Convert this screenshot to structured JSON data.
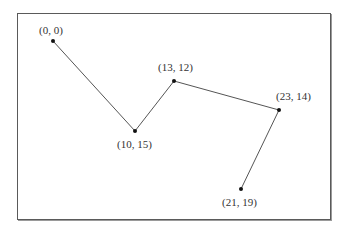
{
  "chart_data": {
    "type": "line",
    "title": "",
    "xlabel": "",
    "ylabel": "",
    "grid": false,
    "points": [
      {
        "label": "(0, 0)",
        "x": 0,
        "y": 0,
        "px": 53,
        "py": 41,
        "lx": 39,
        "ly": 24
      },
      {
        "label": "(10, 15)",
        "x": 10,
        "y": 15,
        "px": 135,
        "py": 131,
        "lx": 117,
        "ly": 138
      },
      {
        "label": "(13, 12)",
        "x": 13,
        "y": 12,
        "px": 174,
        "py": 81,
        "lx": 158,
        "ly": 61
      },
      {
        "label": "(23, 14)",
        "x": 23,
        "y": 14,
        "px": 279,
        "py": 110,
        "lx": 276,
        "ly": 90
      },
      {
        "label": "(21, 19)",
        "x": 21,
        "y": 19,
        "px": 241,
        "py": 189,
        "lx": 222,
        "ly": 196
      }
    ],
    "line_color": "#555555",
    "point_color": "#111111"
  }
}
